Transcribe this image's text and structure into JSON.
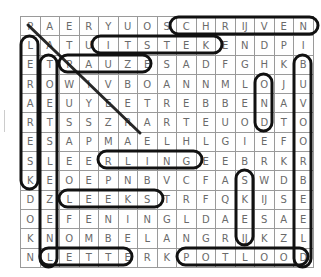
{
  "puzzle": {
    "type": "word-search",
    "rows": 13,
    "cols": 15,
    "grid": [
      [
        "P",
        "A",
        "E",
        "R",
        "Y",
        "U",
        "O",
        "S",
        "C",
        "H",
        "R",
        "IJ",
        "V",
        "E",
        "N"
      ],
      [
        "L",
        "A",
        "T",
        "U",
        "I",
        "T",
        "S",
        "T",
        "E",
        "K",
        "E",
        "N",
        "D",
        "P",
        "I"
      ],
      [
        "E",
        "T",
        "P",
        "A",
        "U",
        "Z",
        "E",
        "S",
        "A",
        "D",
        "F",
        "G",
        "H",
        "K",
        "B"
      ],
      [
        "R",
        "O",
        "W",
        "I",
        "V",
        "B",
        "O",
        "A",
        "N",
        "N",
        "M",
        "L",
        "O",
        "J",
        "U"
      ],
      [
        "A",
        "E",
        "U",
        "Y",
        "E",
        "E",
        "T",
        "R",
        "E",
        "B",
        "B",
        "E",
        "N",
        "A",
        "V"
      ],
      [
        "R",
        "T",
        "S",
        "S",
        "Z",
        "R",
        "A",
        "R",
        "T",
        "E",
        "U",
        "O",
        "D",
        "T",
        "O"
      ],
      [
        "E",
        "S",
        "A",
        "P",
        "M",
        "A",
        "E",
        "L",
        "H",
        "L",
        "G",
        "I",
        "E",
        "F",
        "O"
      ],
      [
        "S",
        "L",
        "E",
        "E",
        "R",
        "L",
        "I",
        "N",
        "G",
        "E",
        "E",
        "B",
        "R",
        "K",
        "R"
      ],
      [
        "K",
        "E",
        "O",
        "E",
        "P",
        "N",
        "B",
        "V",
        "C",
        "F",
        "A",
        "S",
        "W",
        "D",
        "B"
      ],
      [
        "D",
        "Z",
        "L",
        "E",
        "E",
        "K",
        "S",
        "T",
        "R",
        "F",
        "Q",
        "K",
        "IJ",
        "S",
        "E"
      ],
      [
        "O",
        "E",
        "F",
        "E",
        "N",
        "I",
        "N",
        "G",
        "L",
        "D",
        "A",
        "E",
        "S",
        "A",
        "E"
      ],
      [
        "K",
        "N",
        "O",
        "M",
        "B",
        "E",
        "L",
        "A",
        "N",
        "G",
        "R",
        "IJ",
        "K",
        "Z",
        "L"
      ],
      [
        "N",
        "L",
        "E",
        "T",
        "T",
        "E",
        "R",
        "K",
        "P",
        "O",
        "T",
        "L",
        "O",
        "O",
        "D"
      ]
    ],
    "colors": {
      "letters": "#6a6a6a",
      "gridlines": "#9a9a9a",
      "highlights": "#111111",
      "background": "#ffffff"
    }
  }
}
